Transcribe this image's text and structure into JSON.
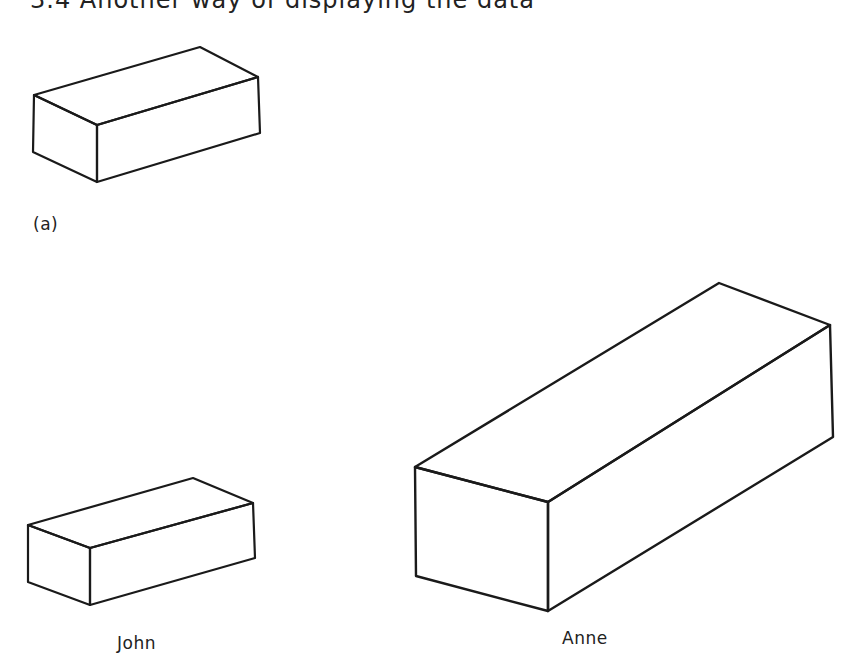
{
  "heading": {
    "text": "3.4   Another way of displaying the data"
  },
  "figure": {
    "panel_label": "(a)",
    "stroke_color": "#1a1a1a",
    "boxes": [
      {
        "name": "reference-box",
        "label": "",
        "points": {
          "left_top": [
            34,
            95
          ],
          "back_top": [
            200,
            47
          ],
          "right_top": [
            258,
            77
          ],
          "front_top": [
            97,
            125
          ],
          "left_bottom": [
            33,
            152
          ],
          "front_bottom": [
            97,
            182
          ],
          "right_bottom": [
            260,
            133
          ]
        }
      },
      {
        "name": "john-box",
        "label": "John",
        "points": {
          "left_top": [
            28,
            525
          ],
          "back_top": [
            193,
            478
          ],
          "right_top": [
            253,
            503
          ],
          "front_top": [
            90,
            548
          ],
          "left_bottom": [
            28,
            582
          ],
          "front_bottom": [
            90,
            605
          ],
          "right_bottom": [
            255,
            558
          ]
        }
      },
      {
        "name": "anne-box",
        "label": "Anne",
        "points": {
          "left_top": [
            415,
            467
          ],
          "back_top": [
            719,
            283
          ],
          "right_top": [
            830,
            325
          ],
          "front_top": [
            548,
            502
          ],
          "left_bottom": [
            416,
            576
          ],
          "front_bottom": [
            548,
            611
          ],
          "right_bottom": [
            833,
            437
          ]
        }
      }
    ]
  }
}
